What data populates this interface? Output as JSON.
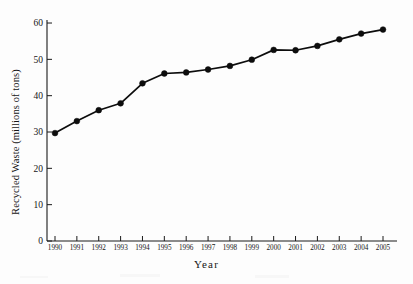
{
  "chart_data": {
    "type": "line",
    "title": "",
    "xlabel": "Year",
    "ylabel": "Recycled Waste (millions of tons)",
    "categories": [
      "1990",
      "1991",
      "1992",
      "1993",
      "1994",
      "1995",
      "1996",
      "1997",
      "1998",
      "1999",
      "2000",
      "2001",
      "2002",
      "2003",
      "2004",
      "2005"
    ],
    "x": [
      1990,
      1991,
      1992,
      1993,
      1994,
      1995,
      1996,
      1997,
      1998,
      1999,
      2000,
      2001,
      2002,
      2003,
      2004,
      2005
    ],
    "values": [
      29.7,
      33.0,
      36.0,
      37.9,
      43.4,
      46.1,
      46.4,
      47.2,
      48.2,
      49.9,
      52.6,
      52.5,
      53.7,
      55.5,
      57.1,
      58.2
    ],
    "series": [
      {
        "name": "Recycled Waste",
        "values": [
          29.7,
          33.0,
          36.0,
          37.9,
          43.4,
          46.1,
          46.4,
          47.2,
          48.2,
          49.9,
          52.6,
          52.5,
          53.7,
          55.5,
          57.1,
          58.2
        ]
      }
    ],
    "ylim": [
      0,
      62
    ],
    "xlim": [
      1989.6,
      2005.4
    ],
    "yticks": [
      0,
      10,
      20,
      30,
      40,
      50,
      60
    ],
    "ytick_labels": [
      "0",
      "10",
      "20",
      "30",
      "40",
      "50",
      "60"
    ],
    "xticks": [
      1990,
      1991,
      1992,
      1993,
      1994,
      1995,
      1996,
      1997,
      1998,
      1999,
      2000,
      2001,
      2002,
      2003,
      2004,
      2005
    ],
    "xtick_labels": [
      "1990",
      "1991",
      "1992",
      "1993",
      "1994",
      "1995",
      "1996",
      "1997",
      "1998",
      "1999",
      "2000",
      "2001",
      "2002",
      "2003",
      "2004",
      "2005"
    ],
    "grid": false,
    "legend": null,
    "legend_position": "none",
    "marker": "filled-circle",
    "line_color": "#0d0d0d",
    "marker_color": "#0d0d0d",
    "axis_color": "#1a1a1a",
    "background_color": "#fdfdfd"
  },
  "axes": {
    "y_title": "Recycled Waste (millions of tons)",
    "x_title": "Year"
  }
}
